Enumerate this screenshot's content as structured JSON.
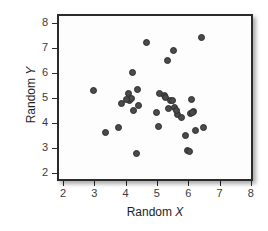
{
  "chart_data": {
    "type": "scatter",
    "title": "",
    "xlabel": "Random X",
    "xlabel_plain": "Random",
    "xlabel_var": "X",
    "ylabel": "Random Y",
    "ylabel_plain": "Random",
    "ylabel_var": "Y",
    "xlim": [
      2,
      8
    ],
    "ylim": [
      2,
      8
    ],
    "xticks": [
      2,
      3,
      4,
      5,
      6,
      7,
      8
    ],
    "yticks": [
      2,
      3,
      4,
      5,
      6,
      7,
      8
    ],
    "xtick_labels": [
      "2",
      "3",
      "4",
      "5",
      "6",
      "7",
      "8"
    ],
    "ytick_labels": [
      "2",
      "3",
      "4",
      "5",
      "6",
      "7",
      "8"
    ],
    "grid": false,
    "legend": null,
    "marker": {
      "shape": "circle",
      "fill_color": "#4a4a4a",
      "edge_color": "#2e2e2e",
      "size_px": 7
    },
    "n_points": 38,
    "points": [
      {
        "x": 2.9,
        "y": 5.38
      },
      {
        "x": 3.3,
        "y": 3.7
      },
      {
        "x": 3.72,
        "y": 3.92
      },
      {
        "x": 3.82,
        "y": 4.88
      },
      {
        "x": 4.02,
        "y": 5.28
      },
      {
        "x": 4.05,
        "y": 4.98
      },
      {
        "x": 4.12,
        "y": 5.08
      },
      {
        "x": 4.15,
        "y": 6.12
      },
      {
        "x": 4.18,
        "y": 4.6
      },
      {
        "x": 4.3,
        "y": 2.87
      },
      {
        "x": 4.33,
        "y": 5.42
      },
      {
        "x": 4.35,
        "y": 4.78
      },
      {
        "x": 4.6,
        "y": 7.32
      },
      {
        "x": 4.92,
        "y": 4.52
      },
      {
        "x": 4.98,
        "y": 3.96
      },
      {
        "x": 5.02,
        "y": 5.26
      },
      {
        "x": 5.18,
        "y": 5.18
      },
      {
        "x": 5.22,
        "y": 5.1
      },
      {
        "x": 5.27,
        "y": 6.6
      },
      {
        "x": 5.38,
        "y": 4.98
      },
      {
        "x": 5.42,
        "y": 5.0
      },
      {
        "x": 5.47,
        "y": 6.98
      },
      {
        "x": 5.5,
        "y": 4.7
      },
      {
        "x": 5.6,
        "y": 4.44
      },
      {
        "x": 5.72,
        "y": 4.3
      },
      {
        "x": 5.85,
        "y": 3.58
      },
      {
        "x": 5.92,
        "y": 2.98
      },
      {
        "x": 5.98,
        "y": 2.96
      },
      {
        "x": 6.0,
        "y": 4.48
      },
      {
        "x": 6.05,
        "y": 5.04
      },
      {
        "x": 6.12,
        "y": 4.54
      },
      {
        "x": 6.18,
        "y": 3.78
      },
      {
        "x": 6.35,
        "y": 7.52
      },
      {
        "x": 6.42,
        "y": 3.92
      },
      {
        "x": 3.95,
        "y": 5.02
      },
      {
        "x": 5.3,
        "y": 4.66
      },
      {
        "x": 6.08,
        "y": 4.5
      },
      {
        "x": 5.55,
        "y": 4.6
      }
    ]
  }
}
